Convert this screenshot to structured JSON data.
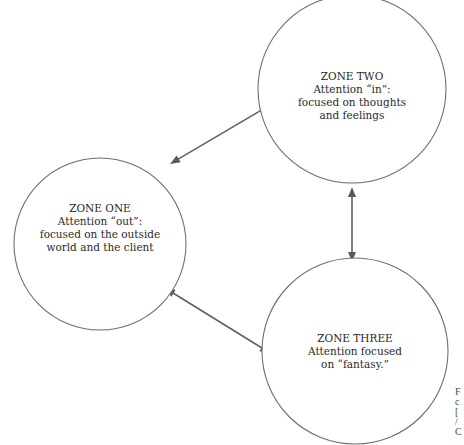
{
  "diagram": {
    "background": "#ffffff",
    "stroke_color": "#6e6e6e",
    "arrow_color": "#5a5a5a",
    "text_color": "#2a2a2a",
    "zones": [
      {
        "id": "zone-one",
        "cx": 100,
        "cy": 244,
        "r": 86,
        "lines": [
          "ZONE ONE",
          "Attention “out”:",
          "focused on the outside",
          "world and the client"
        ],
        "line_y": [
          212,
          225,
          238,
          251
        ]
      },
      {
        "id": "zone-two",
        "cx": 352,
        "cy": 89,
        "r": 94,
        "lines": [
          "ZONE TWO",
          "Attention “in”:",
          "focused on thoughts",
          "and feelings"
        ],
        "line_y": [
          80,
          93,
          106,
          119
        ]
      },
      {
        "id": "zone-three",
        "cx": 355,
        "cy": 351,
        "r": 93,
        "lines": [
          "ZONE  THREE",
          "Attention focused",
          "on “fantasy.”"
        ],
        "line_y": [
          342,
          355,
          368
        ]
      }
    ],
    "connections": [
      {
        "from": "zone-one",
        "to": "zone-two",
        "x1": 170,
        "y1": 164,
        "x2": 270,
        "y2": 105,
        "bidirectional": true
      },
      {
        "from": "zone-one",
        "to": "zone-three",
        "x1": 165,
        "y1": 288,
        "x2": 270,
        "y2": 353,
        "bidirectional": true
      },
      {
        "from": "zone-two",
        "to": "zone-three",
        "x1": 352,
        "y1": 187,
        "x2": 352,
        "y2": 262,
        "bidirectional": true
      }
    ],
    "caption_fragment": {
      "note": "cut-off caption at right edge",
      "chars": [
        "F",
        "c",
        "[",
        "/",
        "C"
      ],
      "x": 455,
      "y": [
        395,
        405,
        415,
        425,
        435
      ]
    }
  }
}
